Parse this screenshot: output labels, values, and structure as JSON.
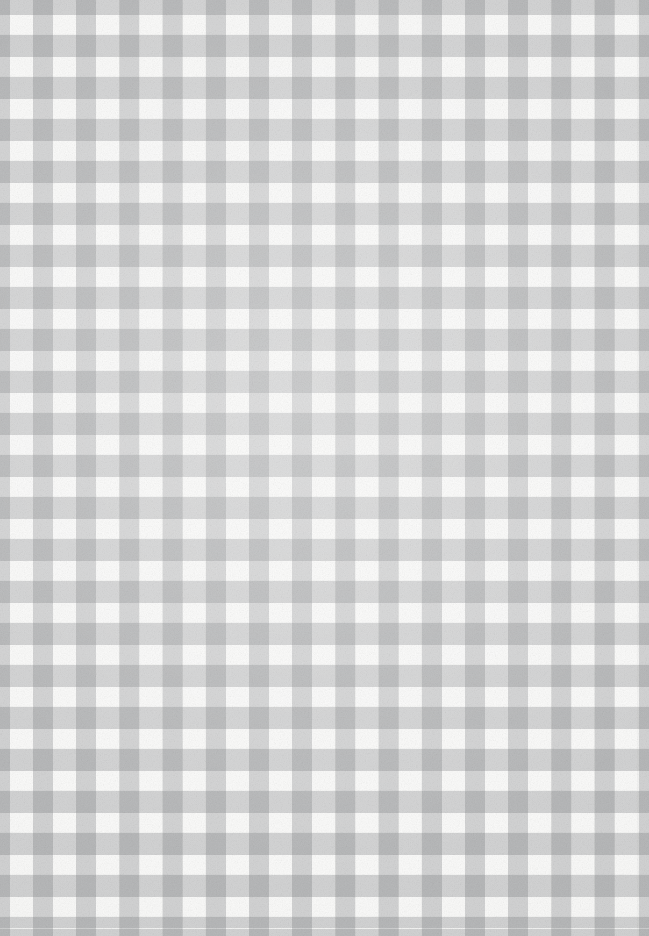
{
  "image": {
    "kind": "scanned-paper-swatch",
    "subject": "gingham check pattern",
    "width_px": 649,
    "height_px": 936,
    "alt_text": "Gray and white gingham check pattern on paper"
  },
  "pattern": {
    "name": "gingham-check",
    "description": "Two-tone woven check: gray warp and weft stripes crossing over a white ground",
    "tone_count": 3,
    "tones": {
      "ground_label": "white",
      "ground_hex": "#FBFBFA",
      "single_overlap_label": "light gray",
      "single_overlap_hex": "#DCDCDC",
      "double_overlap_label": "medium gray",
      "double_overlap_hex": "#9A9A9A"
    },
    "geometry": {
      "horizontal_period_px": 43.2,
      "horizontal_stripe_width_px": 21,
      "horizontal_gap_width_px": 22,
      "horizontal_phase_offset_px": -11,
      "vertical_period_px": 42,
      "vertical_stripe_width_px": 23,
      "vertical_gap_width_px": 19,
      "vertical_phase_offset_px": -8,
      "columns_visible": 15,
      "rows_visible": 22
    },
    "stripe_alpha": 0.3,
    "stripe_base_hex": "#787A7C"
  },
  "texture": {
    "grain_label": "paper fiber grain",
    "grain_opacity": 0.38,
    "vignette_label": "uneven scan lighting"
  },
  "ghost_marks": {
    "top": "",
    "middle": ""
  }
}
